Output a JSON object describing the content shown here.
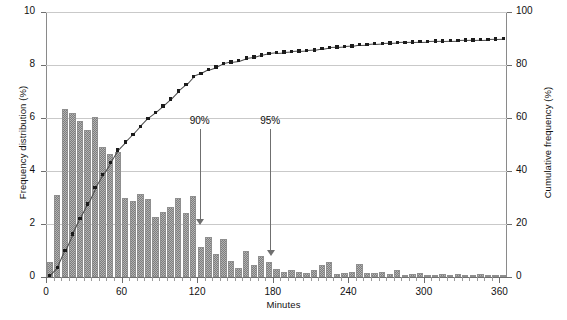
{
  "chart_data": {
    "type": "bar",
    "title": "",
    "xlabel": "Minutes",
    "ylabel": "Frequency distribution (%)",
    "y2label": "Cumulative frequency (%)",
    "xlim": [
      0,
      366
    ],
    "ylim": [
      0,
      10
    ],
    "y2lim": [
      0,
      100
    ],
    "grid": true,
    "legend_position": "none",
    "bin_width": 6,
    "x_ticks_major": [
      0,
      60,
      120,
      180,
      240,
      300,
      360
    ],
    "x_tick_labels": [
      "0",
      "60",
      "120",
      "180",
      "240",
      "300",
      "360"
    ],
    "x_minor_tick_interval": 6,
    "y_ticks_left": [
      0,
      2,
      4,
      6,
      8,
      10
    ],
    "y_tick_labels_left": [
      "0",
      "2",
      "4",
      "6",
      "8",
      "10"
    ],
    "y_ticks_right": [
      0,
      20,
      40,
      60,
      80,
      100
    ],
    "y_tick_labels_right": [
      "0",
      "20",
      "40",
      "60",
      "80",
      "100"
    ],
    "series": [
      {
        "name": "Frequency distribution",
        "type": "bar",
        "axis": "left",
        "x": [
          3,
          9,
          15,
          21,
          27,
          33,
          39,
          45,
          51,
          57,
          63,
          69,
          75,
          81,
          87,
          93,
          99,
          105,
          111,
          117,
          123,
          129,
          135,
          141,
          147,
          153,
          159,
          165,
          171,
          177,
          183,
          189,
          195,
          201,
          207,
          213,
          219,
          225,
          231,
          237,
          243,
          249,
          255,
          261,
          267,
          273,
          279,
          285,
          291,
          297,
          303,
          309,
          315,
          321,
          327,
          333,
          339,
          345,
          351,
          357,
          363
        ],
        "values": [
          0.55,
          3.1,
          6.35,
          6.2,
          5.9,
          5.55,
          6.05,
          4.9,
          4.65,
          4.7,
          3.0,
          2.85,
          3.15,
          2.95,
          2.25,
          2.45,
          2.65,
          3.0,
          2.4,
          3.05,
          1.15,
          1.5,
          0.85,
          1.45,
          0.6,
          0.35,
          1.0,
          0.45,
          0.8,
          0.55,
          0.3,
          0.2,
          0.25,
          0.2,
          0.15,
          0.25,
          0.45,
          0.55,
          0.1,
          0.15,
          0.2,
          0.5,
          0.15,
          0.15,
          0.2,
          0.1,
          0.25,
          0.05,
          0.1,
          0.15,
          0.05,
          0.05,
          0.1,
          0.05,
          0.1,
          0.05,
          0.05,
          0.1,
          0.05,
          0.05,
          0.05
        ]
      },
      {
        "name": "Cumulative frequency",
        "type": "line-markers",
        "axis": "right",
        "x": [
          3,
          9,
          15,
          21,
          27,
          33,
          39,
          45,
          51,
          57,
          63,
          69,
          75,
          81,
          87,
          93,
          99,
          105,
          111,
          117,
          123,
          129,
          135,
          141,
          147,
          153,
          159,
          165,
          171,
          177,
          183,
          189,
          195,
          201,
          207,
          213,
          219,
          225,
          231,
          237,
          243,
          249,
          255,
          261,
          267,
          273,
          279,
          285,
          291,
          297,
          303,
          309,
          315,
          321,
          327,
          333,
          339,
          345,
          351,
          357,
          363
        ],
        "values": [
          0.6,
          3.6,
          10.0,
          16.2,
          22.1,
          27.6,
          33.7,
          38.6,
          43.2,
          47.9,
          50.9,
          53.8,
          56.9,
          59.9,
          62.1,
          64.6,
          67.2,
          70.2,
          72.6,
          75.7,
          76.8,
          78.3,
          79.2,
          80.6,
          81.2,
          81.6,
          82.6,
          83.0,
          83.8,
          84.4,
          84.7,
          84.9,
          85.1,
          85.3,
          85.5,
          85.7,
          86.2,
          86.7,
          86.8,
          87.0,
          87.2,
          87.7,
          87.8,
          88.0,
          88.2,
          88.3,
          88.5,
          88.6,
          88.7,
          88.8,
          88.9,
          89.0,
          89.1,
          89.2,
          89.3,
          89.4,
          89.5,
          89.6,
          89.7,
          89.8,
          89.9
        ]
      }
    ],
    "annotations": [
      {
        "label": "90%",
        "x": 122,
        "label_y_pct": 56,
        "arrow_to_y_pct": 19.5
      },
      {
        "label": "95%",
        "x": 178,
        "label_y_pct": 56,
        "arrow_to_y_pct": 8.0
      }
    ]
  }
}
